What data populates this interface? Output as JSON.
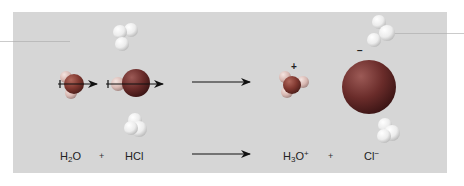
{
  "figure": {
    "background_color": "#d6d6d6",
    "molecules": [
      {
        "id": "water",
        "formula_parts": [
          "H",
          "2",
          "O"
        ],
        "role": "reactant"
      },
      {
        "id": "hydrogen-chloride",
        "formula_parts": [
          "HCl"
        ],
        "role": "reactant"
      },
      {
        "id": "hydronium",
        "formula_parts": [
          "H",
          "3",
          "O",
          "+"
        ],
        "role": "product",
        "charge_symbol": "+"
      },
      {
        "id": "chloride",
        "formula_parts": [
          "Cl",
          "−"
        ],
        "role": "product",
        "charge_symbol": "−"
      }
    ],
    "colors": {
      "oxygen": "#8a3a30",
      "chlorine": "#6b2a2a",
      "hydrogen": "#f2f2f2",
      "arrow": "#111111"
    }
  },
  "equation": {
    "reactant1": {
      "main": "H",
      "sub": "2",
      "tail": "O"
    },
    "plus1": "+",
    "reactant2": "HCl",
    "product1": {
      "main": "H",
      "sub": "3",
      "tail": "O",
      "sup": "+"
    },
    "plus2": "+",
    "product2": {
      "main": "Cl",
      "sup": "−"
    }
  },
  "charges": {
    "hydronium": "+",
    "chloride": "−"
  }
}
